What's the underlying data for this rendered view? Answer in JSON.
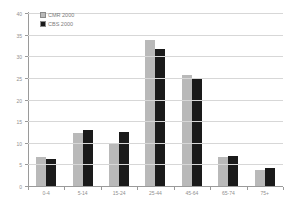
{
  "chart_data": {
    "type": "bar",
    "title": "",
    "xlabel": "",
    "ylabel": "",
    "categories": [
      "0-4",
      "5-14",
      "15-24",
      "25-44",
      "45-64",
      "65-74",
      "75+"
    ],
    "series": [
      {
        "name": "CMR 2000",
        "color": "#b9b9b9",
        "values": [
          7,
          12.5,
          10,
          34,
          26,
          7,
          4
        ]
      },
      {
        "name": "CBS 2000",
        "color": "#1a1a1a",
        "values": [
          6.5,
          13.2,
          12.8,
          32,
          25,
          7.1,
          4.3
        ]
      }
    ],
    "ylim": [
      0,
      40
    ],
    "ytick_step": 5,
    "grid": true,
    "legend_position": "top-left-inside"
  },
  "colors": {
    "background": "#ffffff",
    "gridline": "#d7d7d7",
    "axis": "#9a9a9a",
    "tick_text": "#8f8f8f",
    "legend_text": "#7d7d7d"
  }
}
